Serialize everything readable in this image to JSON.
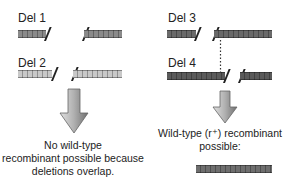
{
  "colors": {
    "del1": "#8a8a8a",
    "del2": "#c9c9c9",
    "del3": "#6a6a6a",
    "del4": "#5a5a5a",
    "wild_type": "#6e6e6e",
    "arrow_light": "#d4d4d4",
    "arrow_dark": "#7a7a7a"
  },
  "left_panel": {
    "del1": {
      "label": "Del 1"
    },
    "del2": {
      "label": "Del 2"
    },
    "result_text_line1": "No wild-type",
    "result_text_line2": "recombinant possible because",
    "result_text_line3": "deletions overlap."
  },
  "right_panel": {
    "del3": {
      "label": "Del 3"
    },
    "del4": {
      "label": "Del 4"
    },
    "result_text_line1": "Wild-type (r⁺) recombinant",
    "result_text_line2": "possible:"
  }
}
